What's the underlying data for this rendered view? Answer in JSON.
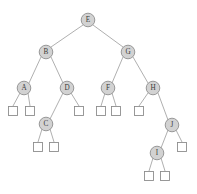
{
  "figure": {
    "type": "binary-search-tree-diagram",
    "caption": "",
    "background_color": "#ffffff",
    "node_fill_color": "#d2d2d2",
    "node_stroke_color": "#8e8e8e",
    "leaf_fill_color": "#ffffff",
    "leaf_stroke_color": "#8e8e8e",
    "edge_color": "#9a9a9a",
    "label_color": "#3a3a3a",
    "node_radius": 6.8,
    "leaf_size": 9
  },
  "nodes": [
    {
      "id": "E",
      "label": "E",
      "cx": 88,
      "cy": 20,
      "depth": 0
    },
    {
      "id": "B",
      "label": "B",
      "cx": 46,
      "cy": 52,
      "depth": 1
    },
    {
      "id": "G",
      "label": "G",
      "cx": 128,
      "cy": 52,
      "depth": 1
    },
    {
      "id": "A",
      "label": "A",
      "cx": 24,
      "cy": 88,
      "depth": 2
    },
    {
      "id": "D",
      "label": "D",
      "cx": 67,
      "cy": 88,
      "depth": 2
    },
    {
      "id": "F",
      "label": "F",
      "cx": 108,
      "cy": 88,
      "depth": 2
    },
    {
      "id": "H",
      "label": "H",
      "cx": 153,
      "cy": 88,
      "depth": 2
    },
    {
      "id": "C",
      "label": "C",
      "cx": 46,
      "cy": 124,
      "depth": 3
    },
    {
      "id": "J",
      "label": "J",
      "cx": 172,
      "cy": 125,
      "depth": 3
    },
    {
      "id": "I",
      "label": "I",
      "cx": 157,
      "cy": 153,
      "depth": 4
    }
  ],
  "leaves": [
    {
      "id": "leaf-A-left",
      "cx": 13,
      "cy": 111,
      "parent": "A"
    },
    {
      "id": "leaf-A-right",
      "cx": 30,
      "cy": 111,
      "parent": "A"
    },
    {
      "id": "leaf-D-right",
      "cx": 79,
      "cy": 111,
      "parent": "D"
    },
    {
      "id": "leaf-C-left",
      "cx": 38,
      "cy": 147,
      "parent": "C"
    },
    {
      "id": "leaf-C-right",
      "cx": 54,
      "cy": 147,
      "parent": "C"
    },
    {
      "id": "leaf-F-left",
      "cx": 101,
      "cy": 111,
      "parent": "F"
    },
    {
      "id": "leaf-F-right",
      "cx": 116,
      "cy": 111,
      "parent": "F"
    },
    {
      "id": "leaf-H-left",
      "cx": 139,
      "cy": 111,
      "parent": "H"
    },
    {
      "id": "leaf-J-right",
      "cx": 182,
      "cy": 147,
      "parent": "J"
    },
    {
      "id": "leaf-I-left",
      "cx": 149,
      "cy": 176,
      "parent": "I"
    },
    {
      "id": "leaf-I-right",
      "cx": 165,
      "cy": 176,
      "parent": "I"
    }
  ],
  "edges": [
    {
      "from": "E",
      "to": "B",
      "x1": 83,
      "y1": 25,
      "x2": 51,
      "y2": 47
    },
    {
      "from": "E",
      "to": "G",
      "x1": 93,
      "y1": 25,
      "x2": 123,
      "y2": 47
    },
    {
      "from": "B",
      "to": "A",
      "x1": 41,
      "y1": 57,
      "x2": 29,
      "y2": 83
    },
    {
      "from": "B",
      "to": "D",
      "x1": 51,
      "y1": 57,
      "x2": 63,
      "y2": 83
    },
    {
      "from": "G",
      "to": "F",
      "x1": 123,
      "y1": 57,
      "x2": 112,
      "y2": 83
    },
    {
      "from": "G",
      "to": "H",
      "x1": 133,
      "y1": 57,
      "x2": 148,
      "y2": 83
    },
    {
      "from": "A",
      "to": "leaf-A-left",
      "x1": 20,
      "y1": 93,
      "x2": 13,
      "y2": 106
    },
    {
      "from": "A",
      "to": "leaf-A-right",
      "x1": 28,
      "y1": 93,
      "x2": 30,
      "y2": 106
    },
    {
      "from": "D",
      "to": "C",
      "x1": 63,
      "y1": 93,
      "x2": 50,
      "y2": 119
    },
    {
      "from": "D",
      "to": "leaf-D-right",
      "x1": 71,
      "y1": 93,
      "x2": 79,
      "y2": 106
    },
    {
      "from": "C",
      "to": "leaf-C-left",
      "x1": 42,
      "y1": 129,
      "x2": 38,
      "y2": 142
    },
    {
      "from": "C",
      "to": "leaf-C-right",
      "x1": 50,
      "y1": 129,
      "x2": 54,
      "y2": 142
    },
    {
      "from": "F",
      "to": "leaf-F-left",
      "x1": 105,
      "y1": 93,
      "x2": 101,
      "y2": 106
    },
    {
      "from": "F",
      "to": "leaf-F-right",
      "x1": 112,
      "y1": 93,
      "x2": 116,
      "y2": 106
    },
    {
      "from": "H",
      "to": "leaf-H-left",
      "x1": 148,
      "y1": 93,
      "x2": 139,
      "y2": 106
    },
    {
      "from": "H",
      "to": "J",
      "x1": 158,
      "y1": 93,
      "x2": 168,
      "y2": 120
    },
    {
      "from": "J",
      "to": "I",
      "x1": 168,
      "y1": 130,
      "x2": 161,
      "y2": 148
    },
    {
      "from": "J",
      "to": "leaf-J-right",
      "x1": 176,
      "y1": 130,
      "x2": 182,
      "y2": 142
    },
    {
      "from": "I",
      "to": "leaf-I-left",
      "x1": 153,
      "y1": 158,
      "x2": 149,
      "y2": 171
    },
    {
      "from": "I",
      "to": "leaf-I-right",
      "x1": 161,
      "y1": 158,
      "x2": 165,
      "y2": 171
    }
  ]
}
